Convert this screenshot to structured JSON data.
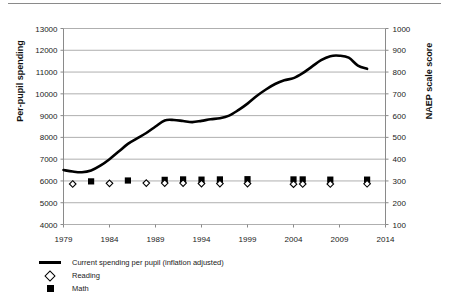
{
  "chart_data": {
    "type": "line",
    "title": "",
    "xlabel": "",
    "ylabel": "Per-pupil spending",
    "y2label": "NAEP scale score",
    "xlim": [
      1979,
      2014
    ],
    "ylim": [
      4000,
      13000
    ],
    "y2lim": [
      100,
      1000
    ],
    "xticks": [
      1979,
      1984,
      1989,
      1994,
      1999,
      2004,
      2009,
      2014
    ],
    "yticks": [
      4000,
      5000,
      6000,
      7000,
      8000,
      9000,
      10000,
      11000,
      12000,
      13000
    ],
    "y2ticks": [
      100,
      200,
      300,
      400,
      500,
      600,
      700,
      800,
      900,
      1000
    ],
    "grid": "horizontal",
    "legend_position": "below-left",
    "series": [
      {
        "name": "Current spending per pupil (inflation adjusted)",
        "axis": "left",
        "type": "line",
        "marker": "none",
        "color": "#000000",
        "x": [
          1979,
          1980,
          1981,
          1982,
          1983,
          1984,
          1985,
          1986,
          1987,
          1988,
          1989,
          1990,
          1991,
          1992,
          1993,
          1994,
          1995,
          1996,
          1997,
          1998,
          1999,
          2000,
          2001,
          2002,
          2003,
          2004,
          2005,
          2006,
          2007,
          2008,
          2009,
          2010,
          2011,
          2012
        ],
        "values": [
          6500,
          6430,
          6400,
          6480,
          6700,
          7000,
          7350,
          7700,
          7950,
          8200,
          8500,
          8780,
          8800,
          8750,
          8700,
          8760,
          8830,
          8880,
          9000,
          9250,
          9550,
          9900,
          10200,
          10450,
          10620,
          10720,
          10950,
          11250,
          11550,
          11730,
          11750,
          11660,
          11300,
          11150
        ]
      },
      {
        "name": "Reading",
        "axis": "right",
        "type": "scatter",
        "marker": "open-diamond",
        "color": "#000000",
        "x": [
          1980,
          1984,
          1988,
          1990,
          1992,
          1994,
          1996,
          1999,
          2004,
          2005,
          2008,
          2012
        ],
        "values": [
          286,
          289,
          290,
          290,
          290,
          288,
          288,
          288,
          285,
          286,
          286,
          287
        ]
      },
      {
        "name": "Math",
        "axis": "right",
        "type": "scatter",
        "marker": "filled-square",
        "color": "#000000",
        "x": [
          1982,
          1986,
          1990,
          1992,
          1994,
          1996,
          1999,
          2004,
          2005,
          2008,
          2012
        ],
        "values": [
          298,
          302,
          305,
          307,
          306,
          307,
          308,
          307,
          307,
          306,
          306
        ]
      }
    ]
  },
  "legend": {
    "items": [
      {
        "key": "line",
        "label": "Current spending per pupil (inflation adjusted)"
      },
      {
        "key": "open-diamond",
        "label": "Reading"
      },
      {
        "key": "filled-square",
        "label": "Math"
      }
    ]
  },
  "axes": {
    "left_title": "Per-pupil spending",
    "right_title": "NAEP scale score"
  }
}
